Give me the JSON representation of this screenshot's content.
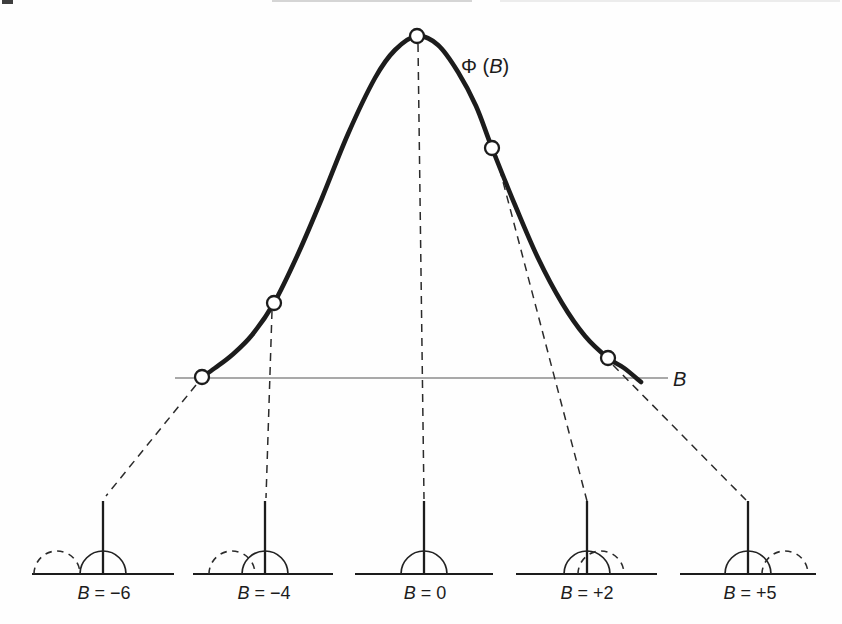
{
  "figure": {
    "title_hint": "Probability function of interference term",
    "curve_label": {
      "prefix": "Φ (",
      "var": "B",
      "suffix": ")"
    },
    "axis_label": "B",
    "marker_B_values": [
      -6,
      -4,
      0,
      2,
      5
    ],
    "mini_labels": [
      {
        "var": "B",
        "eq": " = −6"
      },
      {
        "var": "B",
        "eq": " = −4"
      },
      {
        "var": "B",
        "eq": " = 0"
      },
      {
        "var": "B",
        "eq": " = +2"
      },
      {
        "var": "B",
        "eq": " = +5"
      }
    ]
  },
  "colors": {
    "ink": "#1c1c1c",
    "thin_line": "#555555",
    "background": "#fefefe"
  },
  "geometry": {
    "curve_points": [
      [
        202,
        377
      ],
      [
        215,
        368
      ],
      [
        232,
        355
      ],
      [
        252,
        335
      ],
      [
        274,
        303
      ],
      [
        298,
        254
      ],
      [
        322,
        198
      ],
      [
        348,
        134
      ],
      [
        375,
        78
      ],
      [
        395,
        50
      ],
      [
        417,
        36
      ],
      [
        438,
        45
      ],
      [
        458,
        72
      ],
      [
        476,
        106
      ],
      [
        492,
        148
      ],
      [
        515,
        205
      ],
      [
        538,
        258
      ],
      [
        562,
        303
      ],
      [
        585,
        336
      ],
      [
        608,
        358
      ],
      [
        624,
        368
      ],
      [
        641,
        382
      ]
    ],
    "markers": [
      [
        202,
        377
      ],
      [
        274,
        303
      ],
      [
        417,
        36
      ],
      [
        492,
        148
      ],
      [
        608,
        358
      ]
    ],
    "marker_radius": 7,
    "axis": {
      "x1": 175,
      "x2": 668,
      "y": 378
    },
    "connectors": [
      [
        196,
        385,
        106,
        496
      ],
      [
        272,
        311,
        266,
        498
      ],
      [
        418,
        44,
        424,
        499
      ],
      [
        496,
        155,
        587,
        501
      ],
      [
        613,
        365,
        746,
        500
      ]
    ],
    "minis": [
      {
        "baseline": [
          32,
          174
        ],
        "stick_x": 103,
        "dashed_offset": -46,
        "label_x": 104
      },
      {
        "baseline": [
          193,
          333
        ],
        "stick_x": 265,
        "dashed_offset": -33,
        "label_x": 264
      },
      {
        "baseline": [
          355,
          493
        ],
        "stick_x": 424,
        "dashed_offset": null,
        "label_x": 425
      },
      {
        "baseline": [
          516,
          657
        ],
        "stick_x": 587,
        "dashed_offset": 14,
        "label_x": 587
      },
      {
        "baseline": [
          680,
          816
        ],
        "stick_x": 748,
        "dashed_offset": 37,
        "label_x": 750
      }
    ],
    "mini_base_y": 574,
    "mini_stick_top_y": 501,
    "mini_radius": 23,
    "mini_label_y": 599
  }
}
